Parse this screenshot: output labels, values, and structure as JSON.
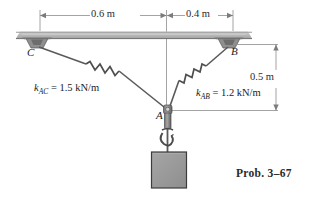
{
  "figure": {
    "caption": "Prob. 3–67",
    "dimensions": {
      "left_span": "0.6 m",
      "right_span": "0.4 m",
      "vertical_drop": "0.5 m"
    },
    "points": {
      "c": "C",
      "b": "B",
      "a": "A"
    },
    "springs": [
      {
        "id": "ac",
        "symbol": "k",
        "subscript": "AC",
        "equals": "=",
        "value": "1.5 kN/m",
        "full_label": "k_AC = 1.5 kN/m"
      },
      {
        "id": "ab",
        "symbol": "k",
        "subscript": "AB",
        "equals": "=",
        "value": "1.2 kN/m",
        "full_label": "k_AB = 1.2 kN/m"
      }
    ],
    "elements": {
      "ceiling": "ceiling-beam",
      "support_c": "wall-mount-bracket-c",
      "support_b": "wall-mount-bracket-b",
      "cable_ac": "cable-segment-ac",
      "cable_ab": "cable-segment-ab",
      "ring_a": "connector-ring-a",
      "hook": "lifting-hook",
      "block": "suspended-block"
    },
    "colors": {
      "ceiling_fill": "#b8b8b8",
      "ceiling_edge": "#7a7a7a",
      "line": "#565656",
      "block_fill": "#9a9a9a",
      "block_edge": "#3a3a3a",
      "dim_line": "#8a8a8a",
      "text": "#222222"
    }
  }
}
